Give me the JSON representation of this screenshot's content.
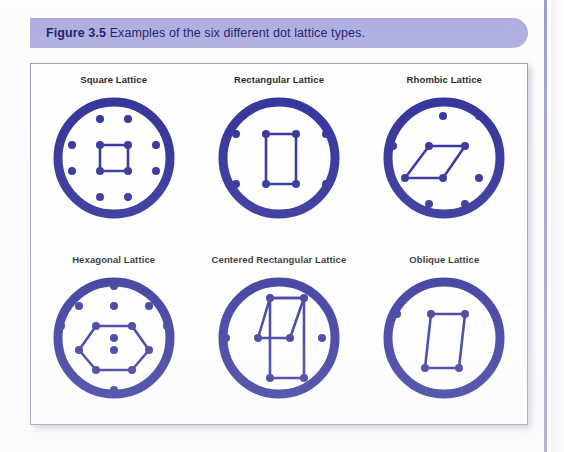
{
  "caption": {
    "figure_number": "Figure 3.5",
    "text": "Examples of the six different dot lattice types."
  },
  "colors": {
    "lattice_blue": "#2b2b96",
    "banner": "#aeaee0",
    "caption_text": "#1f1f6e",
    "panel_border": "#9a9ac0",
    "label_text": "#1d1d1d"
  },
  "figure": {
    "lattices": [
      {
        "id": "square-lattice",
        "label": "Square Lattice",
        "ring": {
          "cx": 75,
          "cy": 70,
          "r": 56,
          "stroke_width": 9
        },
        "dots": [
          [
            33,
            31
          ],
          [
            61,
            31
          ],
          [
            89,
            31
          ],
          [
            117,
            31
          ],
          [
            33,
            57
          ],
          [
            61,
            57
          ],
          [
            89,
            57
          ],
          [
            117,
            57
          ],
          [
            33,
            83
          ],
          [
            61,
            83
          ],
          [
            89,
            83
          ],
          [
            117,
            83
          ],
          [
            33,
            109
          ],
          [
            61,
            109
          ],
          [
            89,
            109
          ],
          [
            117,
            109
          ]
        ],
        "dot_radius": 4,
        "cell_points": "61,57 89,57 89,83 61,83",
        "cell_closed": true
      },
      {
        "id": "rectangular-lattice",
        "label": "Rectangular Lattice",
        "ring": {
          "cx": 75,
          "cy": 70,
          "r": 56,
          "stroke_width": 9
        },
        "dots": [
          [
            32,
            46
          ],
          [
            62,
            46
          ],
          [
            92,
            46
          ],
          [
            122,
            46
          ],
          [
            32,
            96
          ],
          [
            62,
            96
          ],
          [
            92,
            96
          ],
          [
            122,
            96
          ]
        ],
        "dot_radius": 4,
        "cell_points": "62,46 92,46 92,96 62,96",
        "cell_closed": true
      },
      {
        "id": "rhombic-lattice",
        "label": "Rhombic Lattice",
        "ring": {
          "cx": 75,
          "cy": 70,
          "r": 56,
          "stroke_width": 9
        },
        "dots": [
          [
            36,
            28
          ],
          [
            74,
            28
          ],
          [
            110,
            28
          ],
          [
            24,
            58
          ],
          [
            60,
            58
          ],
          [
            96,
            58
          ],
          [
            130,
            58
          ],
          [
            36,
            90
          ],
          [
            74,
            90
          ],
          [
            110,
            90
          ],
          [
            60,
            116
          ],
          [
            96,
            116
          ]
        ],
        "dot_radius": 4,
        "cell_points": "60,58 96,58 74,90 36,90",
        "cell_closed": true
      },
      {
        "id": "hexagonal-lattice",
        "label": "Hexagonal Lattice",
        "ring": {
          "cx": 75,
          "cy": 70,
          "r": 56,
          "stroke_width": 9
        },
        "dots": [
          [
            75,
            18
          ],
          [
            40,
            38
          ],
          [
            75,
            38
          ],
          [
            110,
            38
          ],
          [
            22,
            58
          ],
          [
            57,
            58
          ],
          [
            93,
            58
          ],
          [
            128,
            58
          ],
          [
            75,
            70
          ],
          [
            40,
            82
          ],
          [
            75,
            82
          ],
          [
            110,
            82
          ],
          [
            22,
            100
          ],
          [
            128,
            100
          ],
          [
            57,
            102
          ],
          [
            93,
            102
          ],
          [
            75,
            122
          ]
        ],
        "dot_radius": 4,
        "cell_points": "57,58 93,58 110,82 93,102 57,102 40,82",
        "cell_closed": true
      },
      {
        "id": "centered-rectangular-lattice",
        "label": "Centered Rectangular Lattice",
        "ring": {
          "cx": 75,
          "cy": 70,
          "r": 56,
          "stroke_width": 9
        },
        "dots": [
          [
            34,
            30
          ],
          [
            66,
            30
          ],
          [
            100,
            30
          ],
          [
            130,
            30
          ],
          [
            22,
            70
          ],
          [
            54,
            70
          ],
          [
            86,
            70
          ],
          [
            118,
            70
          ],
          [
            34,
            110
          ],
          [
            66,
            110
          ],
          [
            100,
            110
          ],
          [
            130,
            110
          ]
        ],
        "dot_radius": 4,
        "cell_points": "66,30 100,30 100,110 66,110",
        "cell_closed": true,
        "extra_cell_points": "66,30 100,30 86,70 54,70",
        "extra_cell_closed": true
      },
      {
        "id": "oblique-lattice",
        "label": "Oblique Lattice",
        "ring": {
          "cx": 75,
          "cy": 70,
          "r": 56,
          "stroke_width": 9
        },
        "dots": [
          [
            28,
            46
          ],
          [
            62,
            46
          ],
          [
            96,
            46
          ],
          [
            128,
            46
          ],
          [
            22,
            100
          ],
          [
            56,
            100
          ],
          [
            90,
            100
          ],
          [
            124,
            100
          ]
        ],
        "dot_radius": 4,
        "cell_points": "62,46 96,46 90,100 56,100",
        "cell_closed": true
      }
    ]
  }
}
